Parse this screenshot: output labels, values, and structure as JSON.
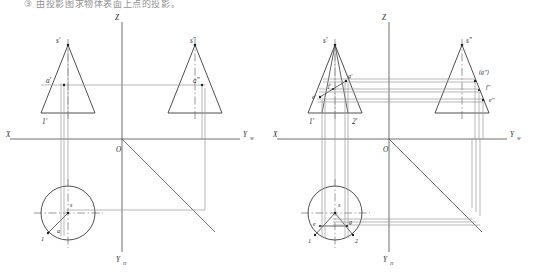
{
  "page": {
    "title_fragment": "③ 由投影图求物体表面上点的投影。",
    "width": 533,
    "height": 272,
    "background": "#ffffff",
    "line_color": "#3a3a3a",
    "thin_line_color": "#8a8a8a",
    "label_color": "#2a2a2a"
  },
  "figures": [
    {
      "id": "figure-left",
      "name": "cone-projection-point-a",
      "axes": {
        "z_label": "Z",
        "x_label": "X",
        "yw_label": "Y",
        "yw_sub": "W",
        "yh_label": "Y",
        "yh_sub": "H",
        "origin_label": "O"
      },
      "front_view": {
        "name": "front-view-cone",
        "apex_label": "s'",
        "point_labels": [
          "a'",
          "1'"
        ]
      },
      "side_view": {
        "name": "side-view-cone",
        "apex_label": "s\"",
        "point_labels": [
          "a\""
        ]
      },
      "top_view": {
        "name": "top-view-cone",
        "center_label": "s",
        "point_labels": [
          "a",
          "1"
        ]
      }
    },
    {
      "id": "figure-right",
      "name": "cone-projection-points-e-f-g",
      "axes": {
        "z_label": "Z",
        "x_label": "X",
        "yw_label": "Y",
        "yw_sub": "W",
        "yh_label": "Y",
        "yh_sub": "H",
        "origin_label": "O"
      },
      "front_view": {
        "name": "front-view-cone",
        "apex_label": "s'",
        "point_labels": [
          "g'",
          "f'",
          "e'",
          "1'",
          "2'"
        ]
      },
      "side_view": {
        "name": "side-view-cone",
        "apex_label": "s\"",
        "point_labels": [
          "(g\")",
          "f\"",
          "e\""
        ]
      },
      "top_view": {
        "name": "top-view-cone",
        "center_label": "s",
        "point_labels": [
          "e",
          "g",
          "1",
          "2"
        ]
      }
    }
  ]
}
